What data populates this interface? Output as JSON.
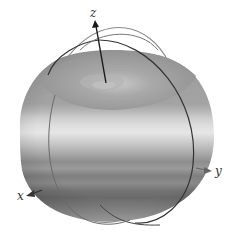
{
  "figure": {
    "axes": {
      "x": {
        "label": "x"
      },
      "y": {
        "label": "y"
      },
      "z": {
        "label": "z"
      }
    },
    "colors": {
      "background": "#ffffff",
      "axis": "#222222",
      "ring_dark": "#3a3a3a",
      "ring_light": "#8a8a8a",
      "top_surface": "#9a9a9a",
      "bands": [
        "#9c9c9c",
        "#a8a8a8",
        "#bdbdbd",
        "#d6d6d6",
        "#e2e2e2",
        "#c4c4c4",
        "#a9a9a9",
        "#8f8f8f",
        "#7d7d7d",
        "#8a8a8a",
        "#6f6f6f",
        "#858585",
        "#959595",
        "#a6a6a6"
      ]
    }
  }
}
